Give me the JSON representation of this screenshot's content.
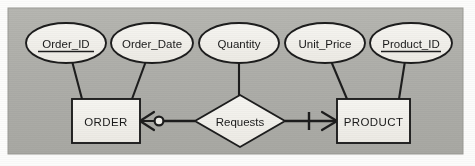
{
  "figure": {
    "notation": "crow's foot",
    "panel_color": "#b0b0ab",
    "shape_fill": "#f2f1ec",
    "line_color": "#1d1d1d",
    "text_color": "#1a1a1a"
  },
  "entities": [
    {
      "id": "order",
      "label": "ORDER",
      "shape": "rectangle",
      "x": 72,
      "y": 99,
      "width": 68,
      "height": 44
    },
    {
      "id": "product",
      "label": "PRODUCT",
      "shape": "rectangle",
      "x": 337,
      "y": 99,
      "width": 73,
      "height": 44
    }
  ],
  "relationship": {
    "id": "requests",
    "label": "Requests",
    "shape": "diamond",
    "cx": 240,
    "cy": 121,
    "rx": 45,
    "ry": 26
  },
  "attributes": [
    {
      "id": "order-id",
      "label": "Order_ID",
      "key": true,
      "owner": "order",
      "cx": 66,
      "cy": 43,
      "rx": 40,
      "ry": 20
    },
    {
      "id": "order-date",
      "label": "Order_Date",
      "key": false,
      "owner": "order",
      "cx": 152,
      "cy": 43,
      "rx": 41,
      "ry": 20
    },
    {
      "id": "quantity",
      "label": "Quantity",
      "key": false,
      "owner": "requests",
      "cx": 239,
      "cy": 43,
      "rx": 40,
      "ry": 20
    },
    {
      "id": "unit-price",
      "label": "Unit_Price",
      "key": false,
      "owner": "product",
      "cx": 325,
      "cy": 43,
      "rx": 40,
      "ry": 20
    },
    {
      "id": "product-id",
      "label": "Product_ID",
      "key": true,
      "owner": "product",
      "cx": 411,
      "cy": 43,
      "rx": 41,
      "ry": 20
    }
  ],
  "connectors": [
    {
      "id": "order-to-requests",
      "from": "order",
      "to": "requests",
      "cardinality_label": "zero or many",
      "symbol": "crows-foot-circle"
    },
    {
      "id": "requests-to-product",
      "from": "requests",
      "to": "product",
      "cardinality_label": "one or many",
      "symbol": "crows-foot-bar"
    }
  ],
  "panel": {
    "x": 8,
    "y": 8,
    "width": 455,
    "height": 146
  }
}
